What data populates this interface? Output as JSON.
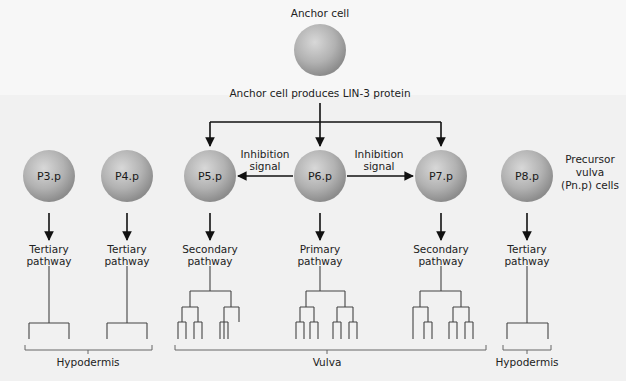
{
  "anchor": {
    "title": "Anchor cell",
    "caption": "Anchor cell produces LIN-3 protein",
    "cx": 320,
    "cy": 50,
    "r": 26
  },
  "cells": [
    {
      "id": "P3.p",
      "cx": 49,
      "cy": 176,
      "pathway": [
        "Tertiary",
        "pathway"
      ],
      "fate": "tertiary"
    },
    {
      "id": "P4.p",
      "cx": 127,
      "cy": 176,
      "pathway": [
        "Tertiary",
        "pathway"
      ],
      "fate": "tertiary"
    },
    {
      "id": "P5.p",
      "cx": 210,
      "cy": 176,
      "pathway": [
        "Secondary",
        "pathway"
      ],
      "fate": "secondary-left"
    },
    {
      "id": "P6.p",
      "cx": 320,
      "cy": 176,
      "pathway": [
        "Primary",
        "pathway"
      ],
      "fate": "primary"
    },
    {
      "id": "P7.p",
      "cx": 441,
      "cy": 176,
      "pathway": [
        "Secondary",
        "pathway"
      ],
      "fate": "secondary-right"
    },
    {
      "id": "P8.p",
      "cx": 527,
      "cy": 176,
      "pathway": [
        "Tertiary",
        "pathway"
      ],
      "fate": "tertiary"
    }
  ],
  "inhibition": {
    "left": [
      "Inhibition",
      "signal"
    ],
    "right": [
      "Inhibition",
      "signal"
    ]
  },
  "precursor_label": [
    "Precursor",
    "vulva",
    "(Pn.p) cells"
  ],
  "tissue_labels": [
    {
      "text": "Hypodermis",
      "x": 88,
      "x1": 25,
      "x2": 152
    },
    {
      "text": "Vulva",
      "x": 327,
      "x1": 175,
      "x2": 486
    },
    {
      "text": "Hypodermis",
      "x": 527,
      "x1": 503,
      "x2": 551
    }
  ],
  "colors": {
    "cell_light": "#cfcfcf",
    "cell_dark": "#8f8f8f",
    "line": "#111111",
    "tree": "#444444"
  }
}
